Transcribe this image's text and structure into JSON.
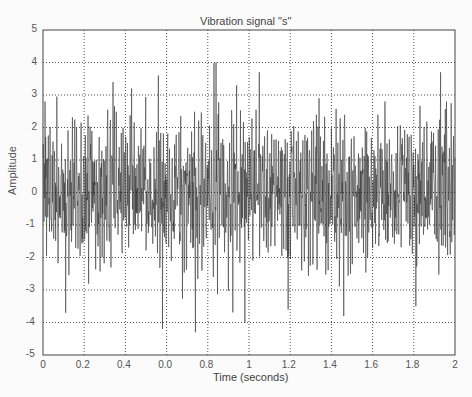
{
  "chart_data": {
    "type": "line",
    "title": "Vibration signal \"s\"",
    "xlabel": "Time (seconds)",
    "ylabel": "Amplitude",
    "xlim": [
      0,
      2
    ],
    "ylim": [
      -5,
      5
    ],
    "x_ticks": [
      0,
      0.2,
      0.4,
      0.6,
      0.8,
      1,
      1.2,
      1.4,
      1.6,
      1.8,
      2
    ],
    "x_tick_labels": [
      "0",
      "0.2",
      "0.4",
      "0.0",
      "0.8",
      "1",
      "1.2",
      "1.4",
      "1.6",
      "1.8",
      "2"
    ],
    "y_ticks": [
      -5,
      -4,
      -3,
      -2,
      -1,
      0,
      1,
      2,
      3,
      4,
      5
    ],
    "y_tick_labels": [
      "-5",
      "-4",
      "-3",
      "-2",
      "-1",
      "0",
      "1",
      "2",
      "3",
      "4",
      "5"
    ],
    "grid": true,
    "grid_style": "dotted",
    "legend": null,
    "series": [
      {
        "name": "s",
        "color": "#3a3a3a",
        "description": "Dense noisy vibration signal, ~2000 samples over 0-2 s, mostly within ±2.5, peaks up to about +4.0 (near t≈0.84) and down to about -4.4 (near t≈0.58-0.62)",
        "notable_peaks": [
          {
            "t": 0.01,
            "y": 2.8
          },
          {
            "t": 0.11,
            "y": -3.7
          },
          {
            "t": 0.34,
            "y": 3.4
          },
          {
            "t": 0.43,
            "y": 3.2
          },
          {
            "t": 0.56,
            "y": 3.6
          },
          {
            "t": 0.58,
            "y": -4.2
          },
          {
            "t": 0.84,
            "y": 4.0
          },
          {
            "t": 0.74,
            "y": -4.3
          },
          {
            "t": 0.94,
            "y": 3.3
          },
          {
            "t": 0.98,
            "y": -4.0
          },
          {
            "t": 1.05,
            "y": 3.7
          },
          {
            "t": 1.19,
            "y": -3.6
          },
          {
            "t": 1.34,
            "y": 2.9
          },
          {
            "t": 1.46,
            "y": -3.8
          },
          {
            "t": 1.66,
            "y": 2.8
          },
          {
            "t": 1.93,
            "y": 3.7
          },
          {
            "t": 1.81,
            "y": -3.5
          }
        ],
        "approx_rms": 1.1,
        "approx_range": [
          -4.4,
          4.0
        ]
      }
    ]
  },
  "page": {
    "caption": "Fig. 20.10  The vibration signal"
  }
}
